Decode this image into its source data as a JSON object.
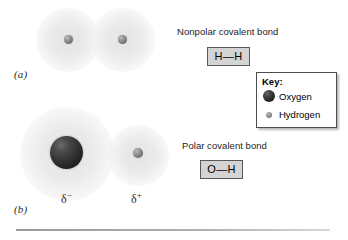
{
  "figure": {
    "panels": [
      {
        "id": "a",
        "label": "(a)",
        "molecule": "H2",
        "bond_type": "Nonpolar covalent bond"
      },
      {
        "id": "b",
        "label": "(b)",
        "molecule": "OH",
        "bond_type": "Polar covalent bond"
      }
    ]
  },
  "panel_a": {
    "label": "(a)",
    "caption": "Nonpolar covalent bond",
    "bond_formula": "H—H",
    "atoms": [
      {
        "element": "Hydrogen",
        "symbol": "H"
      },
      {
        "element": "Hydrogen",
        "symbol": "H"
      }
    ]
  },
  "panel_b": {
    "label": "(b)",
    "caption": "Polar covalent bond",
    "bond_formula": "O—H",
    "atoms": [
      {
        "element": "Oxygen",
        "symbol": "O",
        "partial_charge": "δ",
        "charge_sign": "−"
      },
      {
        "element": "Hydrogen",
        "symbol": "H",
        "partial_charge": "δ",
        "charge_sign": "+"
      }
    ],
    "delta_negative": "δ",
    "delta_negative_sign": "−",
    "delta_positive": "δ",
    "delta_positive_sign": "+"
  },
  "key": {
    "title": "Key:",
    "entries": [
      {
        "label": "Oxygen",
        "swatch": "oxygen-sphere-icon"
      },
      {
        "label": "Hydrogen",
        "swatch": "hydrogen-sphere-icon"
      }
    ]
  },
  "colors": {
    "oxygen_sphere": "#2a2a2a",
    "hydrogen_sphere": "#8a8a8a",
    "electron_cloud": "#e8e8e8",
    "chip_fill": "#d4d4d4",
    "chip_border": "#58585a",
    "key_border": "#4d4d4d",
    "rule": "#9a9a9a",
    "background": "#ffffff"
  }
}
